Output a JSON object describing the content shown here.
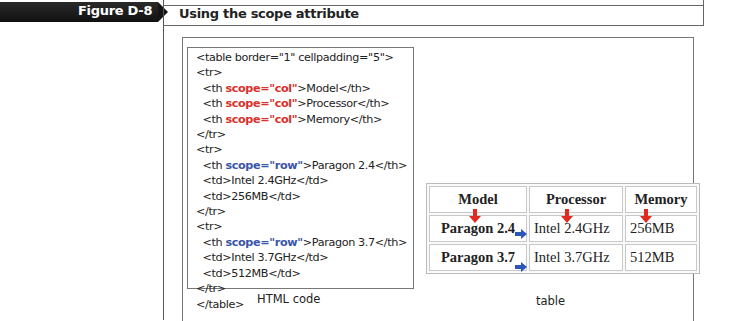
{
  "figure": {
    "label": "Figure D-8",
    "title": "Using the scope attribute"
  },
  "code_panel": {
    "caption": "HTML code",
    "lines": [
      {
        "pre": "<table border=\"1\" cellpadding=\"5\">",
        "attr": "",
        "post": ""
      },
      {
        "pre": "<tr>",
        "attr": "",
        "post": ""
      },
      {
        "pre": "  <th ",
        "attr": "scope=\"col\"",
        "post": ">Model</th>",
        "kind": "col"
      },
      {
        "pre": "  <th ",
        "attr": "scope=\"col\"",
        "post": ">Processor</th>",
        "kind": "col"
      },
      {
        "pre": "  <th ",
        "attr": "scope=\"col\"",
        "post": ">Memory</th>",
        "kind": "col"
      },
      {
        "pre": "</tr>",
        "attr": "",
        "post": ""
      },
      {
        "pre": "<tr>",
        "attr": "",
        "post": ""
      },
      {
        "pre": "  <th ",
        "attr": "scope=\"row\"",
        "post": ">Paragon 2.4</th>",
        "kind": "row"
      },
      {
        "pre": "  <td>Intel 2.4GHz</td>",
        "attr": "",
        "post": ""
      },
      {
        "pre": "  <td>256MB</td>",
        "attr": "",
        "post": ""
      },
      {
        "pre": "</tr>",
        "attr": "",
        "post": ""
      },
      {
        "pre": "<tr>",
        "attr": "",
        "post": ""
      },
      {
        "pre": "  <th ",
        "attr": "scope=\"row\"",
        "post": ">Paragon 3.7</th>",
        "kind": "row"
      },
      {
        "pre": "  <td>Intel 3.7GHz</td>",
        "attr": "",
        "post": ""
      },
      {
        "pre": "  <td>512MB</td>",
        "attr": "",
        "post": ""
      },
      {
        "pre": "</tr>",
        "attr": "",
        "post": ""
      },
      {
        "pre": "</table>",
        "attr": "",
        "post": ""
      }
    ]
  },
  "table_panel": {
    "caption": "table",
    "headers": [
      "Model",
      "Processor",
      "Memory"
    ],
    "rows": [
      {
        "header": "Paragon 2.4",
        "cells": [
          "Intel 2.4GHz",
          "256MB"
        ]
      },
      {
        "header": "Paragon 3.7",
        "cells": [
          "Intel 3.7GHz",
          "512MB"
        ]
      }
    ],
    "arrows": {
      "col_color": "#e0291f",
      "row_color": "#2b55b8"
    }
  },
  "colors": {
    "scope_col": "#d9312b",
    "scope_row": "#3a55a8",
    "banner": "#151515"
  }
}
